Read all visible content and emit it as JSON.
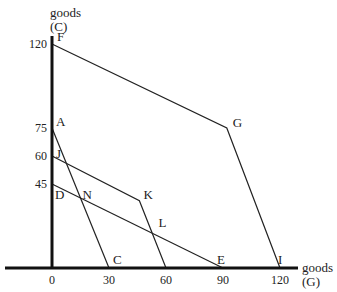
{
  "diagram": {
    "type": "production-possibility-frontiers",
    "y_axis": {
      "label_line1": "goods",
      "label_line2": "(C)",
      "ticks": [
        120,
        75,
        60,
        45
      ]
    },
    "x_axis": {
      "label_line1": "goods",
      "label_line2": "(G)",
      "ticks": [
        0,
        30,
        60,
        90,
        120
      ]
    },
    "points": [
      {
        "name": "F",
        "x": 0,
        "y": 120
      },
      {
        "name": "G",
        "x": 92,
        "y": 75
      },
      {
        "name": "I",
        "x": 120,
        "y": 0
      },
      {
        "name": "A",
        "x": 0,
        "y": 75
      },
      {
        "name": "C",
        "x": 30,
        "y": 0
      },
      {
        "name": "J",
        "x": 0,
        "y": 60
      },
      {
        "name": "K",
        "x": 46,
        "y": 36
      },
      {
        "name": "D",
        "x": 0,
        "y": 45
      },
      {
        "name": "E",
        "x": 90,
        "y": 0
      },
      {
        "name": "N",
        "x": 15,
        "y": 37
      },
      {
        "name": "L",
        "x": 54,
        "y": 21
      }
    ],
    "lines": [
      {
        "name": "frontier-FGI",
        "points": [
          [
            0,
            120
          ],
          [
            92,
            75
          ],
          [
            120,
            0
          ]
        ]
      },
      {
        "name": "line-AC",
        "points": [
          [
            0,
            75
          ],
          [
            30,
            0
          ]
        ]
      },
      {
        "name": "frontier-JK60",
        "points": [
          [
            0,
            60
          ],
          [
            46,
            36
          ],
          [
            60,
            0
          ]
        ]
      },
      {
        "name": "line-DE",
        "points": [
          [
            0,
            45
          ],
          [
            90,
            0
          ]
        ]
      }
    ]
  }
}
